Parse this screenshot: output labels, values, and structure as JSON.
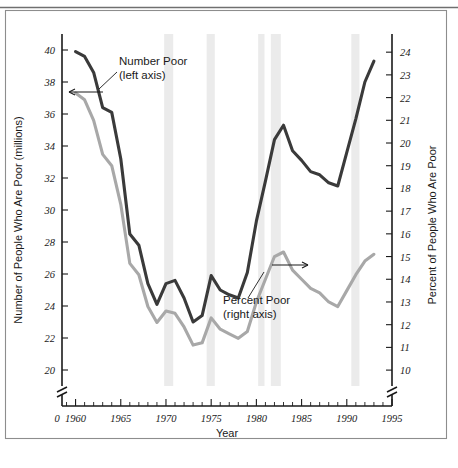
{
  "figure": {
    "background_color": "#ffffff",
    "frame_color": "#8d8d8d"
  },
  "chart_data": {
    "type": "line",
    "title": "",
    "xlabel": "Year",
    "y_left_label": "Number of People Who Are Poor (millions)",
    "y_right_label": "Percent of People Who Are Poor",
    "x": [
      1960,
      1961,
      1962,
      1963,
      1964,
      1965,
      1966,
      1967,
      1968,
      1969,
      1970,
      1971,
      1972,
      1973,
      1974,
      1975,
      1976,
      1977,
      1978,
      1979,
      1980,
      1981,
      1982,
      1983,
      1984,
      1985,
      1986,
      1987,
      1988,
      1989,
      1990,
      1991,
      1992,
      1993
    ],
    "xlim": [
      1958.5,
      1995
    ],
    "xticks_major": [
      1960,
      1965,
      1970,
      1975,
      1980,
      1985,
      1990,
      1995
    ],
    "xtick_labels": [
      "1960",
      "1965",
      "1970",
      "1975",
      "1980",
      "1985",
      "1990",
      "1995"
    ],
    "x_origin_label": "0",
    "left_axis": {
      "ylim": [
        19.0,
        41.0
      ],
      "ticks": [
        20,
        22,
        24,
        26,
        28,
        30,
        32,
        34,
        36,
        38,
        40
      ],
      "tick_labels": [
        "20",
        "22",
        "24",
        "26",
        "28",
        "30",
        "32",
        "34",
        "36",
        "38",
        "40"
      ],
      "has_break": true
    },
    "right_axis": {
      "ylim": [
        9.3,
        24.8
      ],
      "ticks": [
        10,
        11,
        12,
        13,
        14,
        15,
        16,
        17,
        18,
        19,
        20,
        21,
        22,
        23,
        24
      ],
      "tick_labels": [
        "10",
        "11",
        "12",
        "13",
        "14",
        "15",
        "16",
        "17",
        "18",
        "19",
        "20",
        "21",
        "22",
        "23",
        "24"
      ],
      "has_break": true
    },
    "grid": false,
    "legend_position": "inline-annotations",
    "series": [
      {
        "name": "Number Poor",
        "axis": "left",
        "color": "#3a3a3a",
        "values": [
          39.9,
          39.6,
          38.6,
          36.4,
          36.1,
          33.2,
          28.5,
          27.8,
          25.4,
          24.1,
          25.4,
          25.6,
          24.5,
          23.0,
          23.4,
          25.9,
          25.0,
          24.7,
          24.5,
          26.1,
          29.3,
          31.8,
          34.4,
          35.3,
          33.7,
          33.1,
          32.4,
          32.2,
          31.7,
          31.5,
          33.6,
          35.7,
          38.0,
          39.3
        ]
      },
      {
        "name": "Percent Poor",
        "axis": "right",
        "color": "#a8a8a8",
        "values": [
          22.2,
          21.9,
          21.0,
          19.5,
          19.0,
          17.3,
          14.7,
          14.2,
          12.8,
          12.1,
          12.6,
          12.5,
          11.9,
          11.1,
          11.2,
          12.3,
          11.8,
          11.6,
          11.4,
          11.7,
          13.0,
          14.0,
          15.0,
          15.2,
          14.4,
          14.0,
          13.6,
          13.4,
          13.0,
          12.8,
          13.5,
          14.2,
          14.8,
          15.1
        ]
      }
    ],
    "shaded_bands": [
      {
        "name": "recession-1969-1970",
        "start": 1969.8,
        "end": 1970.8
      },
      {
        "name": "recession-1973-1975",
        "start": 1974.5,
        "end": 1975.4
      },
      {
        "name": "recession-1980",
        "start": 1980.2,
        "end": 1980.9
      },
      {
        "name": "recession-1981-1982",
        "start": 1981.6,
        "end": 1982.7
      },
      {
        "name": "recession-1990-1991",
        "start": 1990.5,
        "end": 1991.4
      }
    ],
    "annotations": [
      {
        "name": "number-poor-label",
        "line1": "Number Poor",
        "line2": "(left axis)"
      },
      {
        "name": "percent-poor-label",
        "line1": "Percent Poor",
        "line2": "(right axis)"
      }
    ],
    "axis_arrows": [
      {
        "name": "left-axis-arrow",
        "direction": "left"
      },
      {
        "name": "right-axis-arrow",
        "direction": "right"
      }
    ]
  }
}
